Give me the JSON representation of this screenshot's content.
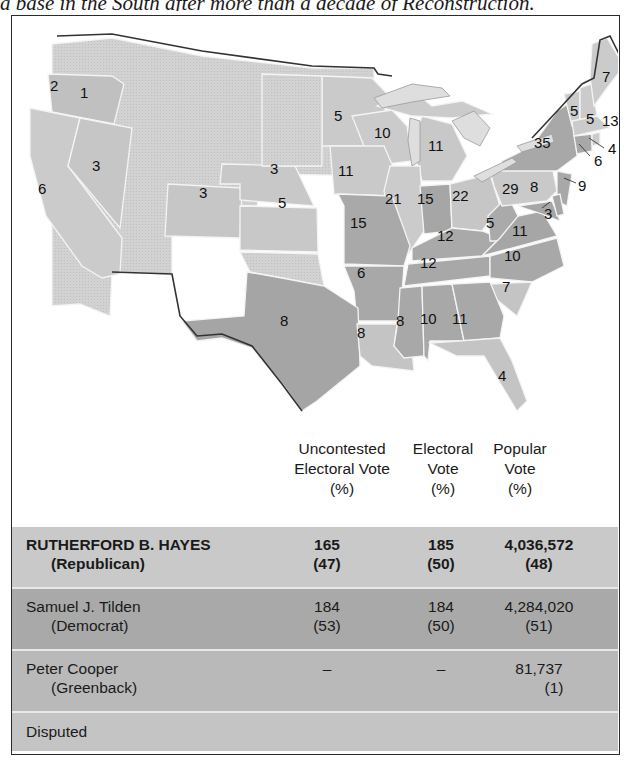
{
  "caption": "a base in the South after more than a decade of Reconstruction.",
  "colors": {
    "republican": "#c9c9c9",
    "democrat": "#a9a9a9",
    "greenback": "#b9b9b9",
    "disputed": "#c4c4c4",
    "territory": "#d6d6d6",
    "border": "#2a2a2a"
  },
  "map": {
    "title": "Election of 1876 electoral votes by state",
    "states": [
      {
        "abbr": "OR",
        "label": "1"
      },
      {
        "abbr": "OR-west",
        "label": "2"
      },
      {
        "abbr": "NV",
        "label": "3"
      },
      {
        "abbr": "CA",
        "label": "6"
      },
      {
        "abbr": "CO",
        "label": "3"
      },
      {
        "abbr": "NE",
        "label": "3"
      },
      {
        "abbr": "KS",
        "label": "5"
      },
      {
        "abbr": "MN",
        "label": "5"
      },
      {
        "abbr": "WI",
        "label": "10"
      },
      {
        "abbr": "MI",
        "label": "11"
      },
      {
        "abbr": "IA",
        "label": "11"
      },
      {
        "abbr": "IL",
        "label": "21"
      },
      {
        "abbr": "IN",
        "label": "15"
      },
      {
        "abbr": "OH",
        "label": "22"
      },
      {
        "abbr": "MO",
        "label": "15"
      },
      {
        "abbr": "KY",
        "label": "12"
      },
      {
        "abbr": "WV",
        "label": "5"
      },
      {
        "abbr": "VA",
        "label": "11"
      },
      {
        "abbr": "TN",
        "label": "12"
      },
      {
        "abbr": "NC",
        "label": "10"
      },
      {
        "abbr": "SC",
        "label": "7"
      },
      {
        "abbr": "AR",
        "label": "6"
      },
      {
        "abbr": "TX",
        "label": "8"
      },
      {
        "abbr": "LA",
        "label": "8"
      },
      {
        "abbr": "MS",
        "label": "8"
      },
      {
        "abbr": "AL",
        "label": "10"
      },
      {
        "abbr": "GA",
        "label": "11"
      },
      {
        "abbr": "FL",
        "label": "4"
      },
      {
        "abbr": "PA",
        "label": "29"
      },
      {
        "abbr": "NY",
        "label": "35"
      },
      {
        "abbr": "VT",
        "label": "5"
      },
      {
        "abbr": "NH",
        "label": "5"
      },
      {
        "abbr": "ME",
        "label": "7"
      },
      {
        "abbr": "MA",
        "label": "13"
      },
      {
        "abbr": "RI",
        "label": "4"
      },
      {
        "abbr": "CT",
        "label": "6"
      },
      {
        "abbr": "NJ",
        "label": "9"
      },
      {
        "abbr": "MD",
        "label": "8"
      },
      {
        "abbr": "DE",
        "label": "3"
      }
    ]
  },
  "table": {
    "headers": {
      "uncontested": [
        "Uncontested",
        "Electoral Vote",
        "(%)"
      ],
      "electoral": [
        "Electoral",
        "Vote",
        "(%)"
      ],
      "popular": [
        "Popular",
        "Vote",
        "(%)"
      ]
    },
    "rows": [
      {
        "name": "RUTHERFORD B. HAYES",
        "party": "(Republican)",
        "uncontested": "165",
        "uncontested_pct": "(47)",
        "electoral": "185",
        "electoral_pct": "(50)",
        "popular": "4,036,572",
        "popular_pct": "(48)"
      },
      {
        "name": "Samuel J. Tilden",
        "party": "(Democrat)",
        "uncontested": "184",
        "uncontested_pct": "(53)",
        "electoral": "184",
        "electoral_pct": "(50)",
        "popular": "4,284,020",
        "popular_pct": "(51)"
      },
      {
        "name": "Peter Cooper",
        "party": "(Greenback)",
        "uncontested": "–",
        "uncontested_pct": "",
        "electoral": "–",
        "electoral_pct": "",
        "popular": "81,737",
        "popular_pct": "(1)"
      },
      {
        "name": "Disputed"
      }
    ]
  }
}
